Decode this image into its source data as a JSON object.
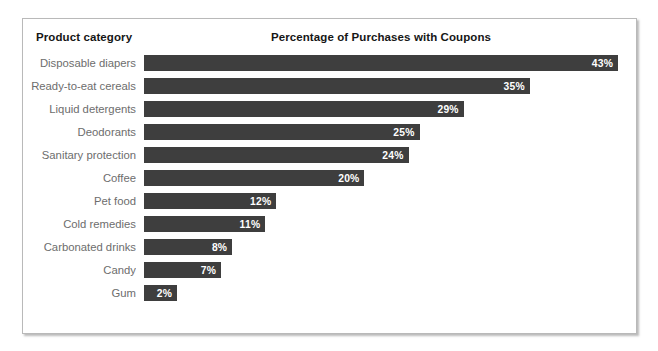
{
  "header": {
    "category_header": "Product category",
    "title": "Percentage of Purchases with Coupons"
  },
  "colors": {
    "bar": "#3e3e3e",
    "bar_value_text": "#ffffff",
    "category_label": "#6d6d6d",
    "header_text": "#161616",
    "frame_border": "#b9b9b9",
    "background": "#ffffff"
  },
  "chart_data": {
    "type": "bar",
    "orientation": "horizontal",
    "title": "Percentage of Purchases with Coupons",
    "xlabel": "",
    "ylabel": "Product category",
    "xlim": [
      0,
      43
    ],
    "grid": false,
    "legend": "none",
    "value_suffix": "%",
    "categories": [
      "Disposable diapers",
      "Ready-to-eat cereals",
      "Liquid detergents",
      "Deodorants",
      "Sanitary protection",
      "Coffee",
      "Pet food",
      "Cold remedies",
      "Carbonated drinks",
      "Candy",
      "Gum"
    ],
    "values": [
      43,
      35,
      29,
      25,
      24,
      20,
      12,
      11,
      8,
      7,
      2
    ],
    "labels": [
      "43%",
      "35%",
      "29%",
      "25%",
      "24%",
      "20%",
      "12%",
      "11%",
      "8%",
      "7%",
      "2%"
    ]
  },
  "rows": [
    {
      "label": "Disposable diapers",
      "value": 43,
      "value_label": "43%"
    },
    {
      "label": "Ready-to-eat cereals",
      "value": 35,
      "value_label": "35%"
    },
    {
      "label": "Liquid detergents",
      "value": 29,
      "value_label": "29%"
    },
    {
      "label": "Deodorants",
      "value": 25,
      "value_label": "25%"
    },
    {
      "label": "Sanitary protection",
      "value": 24,
      "value_label": "24%"
    },
    {
      "label": "Coffee",
      "value": 20,
      "value_label": "20%"
    },
    {
      "label": "Pet food",
      "value": 12,
      "value_label": "12%"
    },
    {
      "label": "Cold remedies",
      "value": 11,
      "value_label": "11%"
    },
    {
      "label": "Carbonated drinks",
      "value": 8,
      "value_label": "8%"
    },
    {
      "label": "Candy",
      "value": 7,
      "value_label": "7%"
    },
    {
      "label": "Gum",
      "value": 2,
      "value_label": "2%"
    }
  ]
}
